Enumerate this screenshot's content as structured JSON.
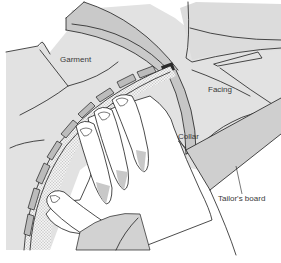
{
  "figure": {
    "labels": {
      "garment": "Garment",
      "facing": "Facing",
      "collar": "Collar",
      "tailors_board": "Tailor's board"
    },
    "colors": {
      "background": "#ffffff",
      "light_fill": "#e2e2e2",
      "mid_fill": "#d4d4d4",
      "dark_fill": "#c4c4c4",
      "board_fill": "#cfcfcf",
      "hand_fill": "#ffffff",
      "stroke": "#1e1e1e"
    }
  }
}
